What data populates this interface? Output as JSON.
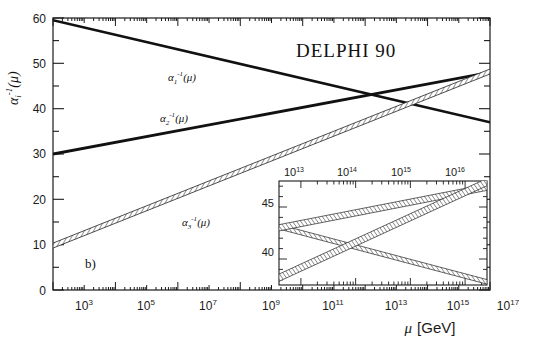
{
  "figure": {
    "title": "DELPHI 90",
    "panel_label": "b)"
  },
  "chart_data": {
    "type": "line",
    "title": "DELPHI 90",
    "xlabel": "μ [GeV]",
    "ylabel": "αi-1(μ)",
    "xscale": "log",
    "xlim": [
      1000,
      1e+17
    ],
    "ylim": [
      0,
      60
    ],
    "yticks": [
      0,
      10,
      20,
      30,
      40,
      50,
      60
    ],
    "xticks_exponents": [
      3,
      5,
      7,
      9,
      11,
      13,
      15,
      17
    ],
    "grid": false,
    "legend": "inline-annotations",
    "series": [
      {
        "name": "α1-1(μ)",
        "label_base": "α",
        "label_sub": "1",
        "label_sup": "-1",
        "label_arg": "(μ)",
        "style": "solid-thick",
        "x": [
          1000,
          1e+17
        ],
        "y": [
          59.5,
          37.0
        ],
        "label_x_exp": 7.6,
        "label_y": 50.5
      },
      {
        "name": "α2-1(μ)",
        "label_base": "α",
        "label_sub": "2",
        "label_sup": "-1",
        "label_arg": "(μ)",
        "style": "solid-thick",
        "x": [
          1000,
          1e+17
        ],
        "y": [
          30.0,
          48.0
        ],
        "label_x_exp": 7.3,
        "label_y": 40.5
      },
      {
        "name": "α3-1(μ)",
        "label_base": "α",
        "label_sub": "3",
        "label_sup": "-1",
        "label_arg": "(μ)",
        "style": "hatched-band",
        "x": [
          1000,
          1e+17
        ],
        "y": [
          9.8,
          48.2
        ],
        "band_halfwidth": 0.55,
        "label_x_exp": 8.2,
        "label_y": 16.5
      }
    ]
  },
  "inset": {
    "xlim_exponents": [
      12.6,
      16.4
    ],
    "ylim": [
      37.5,
      47.5
    ],
    "yticks": [
      40,
      45
    ],
    "xticks_exponents": [
      13,
      14,
      15,
      16
    ],
    "xtick_labels": [
      "10",
      "10",
      "10",
      "10"
    ],
    "xtick_sups": [
      "13",
      "14",
      "15",
      "16"
    ],
    "ytick_labels": [
      "45",
      "40"
    ],
    "series": [
      {
        "name": "α1-1",
        "x_exp": [
          12.6,
          16.4
        ],
        "y": [
          43.1,
          37.8
        ],
        "halfwidth": 0.22
      },
      {
        "name": "α2-1",
        "x_exp": [
          12.6,
          16.4
        ],
        "y": [
          43.0,
          46.9
        ],
        "halfwidth": 0.3
      },
      {
        "name": "α3-1",
        "x_exp": [
          12.6,
          16.4
        ],
        "y": [
          38.2,
          47.4
        ],
        "halfwidth": 0.35
      }
    ]
  },
  "axes": {
    "y_tick_labels": [
      "60",
      "50",
      "40",
      "30",
      "20",
      "10",
      "0"
    ],
    "x_tick_bases": [
      "10",
      "10",
      "10",
      "10",
      "10",
      "10",
      "10",
      "10"
    ],
    "x_tick_sups": [
      "3",
      "5",
      "7",
      "9",
      "11",
      "13",
      "15",
      "17"
    ],
    "xaxis_title_base": "μ",
    "xaxis_title_unit": "[GeV]",
    "yaxis_title_base": "α",
    "yaxis_title_sub": "i",
    "yaxis_title_sup": "-1",
    "yaxis_title_arg": "(μ)"
  },
  "colors": {
    "ink": "#111111",
    "frame": "#1a1a1a",
    "band_fill": "#ffffff",
    "band_hatch": "#333333"
  }
}
